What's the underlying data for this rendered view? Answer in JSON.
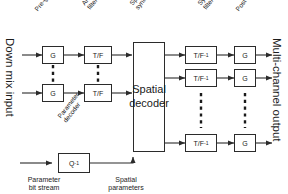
{
  "diagram": {
    "colors": {
      "line": "#2b2b2b",
      "text": "#1c1c1c",
      "background": "#ffffff",
      "dashed": "#1a1a1a"
    },
    "io_labels": {
      "input": "Down mix input",
      "output": "Multi-channel output"
    },
    "stage_labels": [
      {
        "id": "pre-gain",
        "text": "Pre-gain"
      },
      {
        "id": "analysis-filterbank",
        "text": "Analysis\nfilterbank"
      },
      {
        "id": "spatial-synthesis",
        "text": "Spatial\nsynthesis"
      },
      {
        "id": "synthesis-filterbank",
        "text": "Synthesis\nfilterbank"
      },
      {
        "id": "post-gain",
        "text": "Post-gain"
      },
      {
        "id": "parameter-decoder",
        "text": "Parameter\ndecoder"
      }
    ],
    "blocks": {
      "input_gain_top": "G",
      "input_gain_bottom": "G",
      "analysis_tf_top": "T/F",
      "analysis_tf_bottom": "T/F",
      "decoder_line1": "Spatial",
      "decoder_line2": "decoder",
      "synth_tf_1": "T/F",
      "synth_tf_2": "T/F",
      "synth_tf_3": "T/F",
      "synth_tf_exp": "-1",
      "output_gain_1": "G",
      "output_gain_2": "G",
      "output_gain_3": "G",
      "quantizer": "Q",
      "quantizer_exp": "-1"
    },
    "bottom_labels": {
      "bitstream_line1": "Parameter",
      "bitstream_line2": "bit stream",
      "spatial_params_line1": "Spatial",
      "spatial_params_line2": "parameters"
    },
    "icons": {
      "arrow": "arrowhead-icon",
      "vertical_ellipsis": "vertical-dotted-ellipsis-icon"
    }
  }
}
